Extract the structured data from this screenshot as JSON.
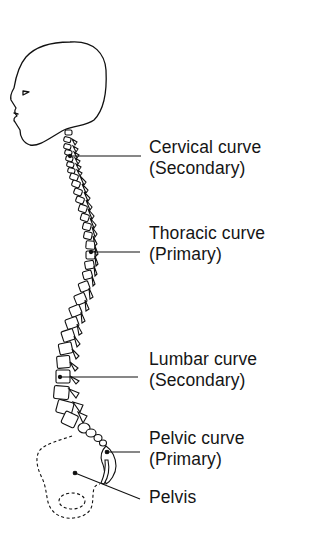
{
  "diagram": {
    "labels": [
      {
        "id": "cervical",
        "line1": "Cervical curve",
        "line2": "(Secondary)"
      },
      {
        "id": "thoracic",
        "line1": "Thoracic curve",
        "line2": "(Primary)"
      },
      {
        "id": "lumbar",
        "line1": "Lumbar curve",
        "line2": "(Secondary)"
      },
      {
        "id": "pelvic",
        "line1": "Pelvic curve",
        "line2": "(Primary)"
      },
      {
        "id": "pelvis",
        "line1": "Pelvis"
      }
    ],
    "colors": {
      "line": "#111111",
      "background": "#ffffff"
    }
  }
}
